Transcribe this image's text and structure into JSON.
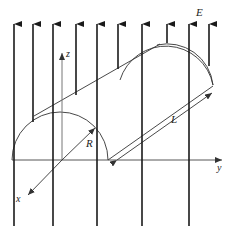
{
  "figure": {
    "labels": {
      "field": "E",
      "radius": "R",
      "length": "L",
      "x_axis": "x",
      "y_axis": "y",
      "z_axis": "z"
    },
    "colors": {
      "field_lines": "#1a1a1a",
      "outline": "#333333",
      "axes": "#444444",
      "background": "#ffffff"
    }
  }
}
